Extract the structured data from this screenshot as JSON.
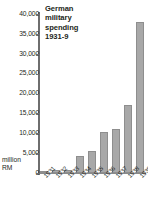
{
  "chart_data": {
    "type": "bar",
    "title": "German\nmilitary\nspending\n1931-9",
    "categories": [
      "1931",
      "1932",
      "1933",
      "1934",
      "1935",
      "1936",
      "1937",
      "1938",
      "1939"
    ],
    "values": [
      610,
      720,
      750,
      4200,
      5500,
      10300,
      11000,
      17200,
      38000
    ],
    "xlabel": "",
    "ylabel": "million RM",
    "ylim": [
      0,
      40000
    ],
    "ytick_labels": [
      "40,000",
      "35,000",
      "30,000",
      "25,000",
      "20,000",
      "15,000",
      "10,000",
      "5,000",
      "0"
    ],
    "ytick_values": [
      40000,
      35000,
      30000,
      25000,
      20000,
      15000,
      10000,
      5000,
      0
    ],
    "grid": false,
    "legend": null,
    "bar_color": "#a8a8a8",
    "axis_color": "#6e6e6e",
    "text_color": "#231f20"
  },
  "axis": {
    "unit_line_1": "million",
    "unit_line_2": "RM"
  }
}
